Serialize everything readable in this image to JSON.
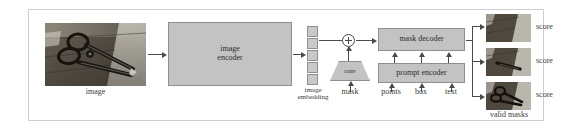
{
  "figure": {
    "frame_color": "#cfcfcf",
    "block_fill": "#c3c3c3",
    "block_stroke": "#8f8f8f",
    "line_color": "#4a4a4a"
  },
  "input": {
    "label": "image",
    "photo_alt": "photograph of scissors on a dark wooden surface"
  },
  "image_encoder": {
    "label_line1": "image",
    "label_line2": "encoder"
  },
  "image_embedding": {
    "label_line1": "image",
    "label_line2": "embedding",
    "cell_count": 5
  },
  "operator": {
    "symbol": "plus-in-circle",
    "name": "element-wise-sum"
  },
  "conv": {
    "label": "conv"
  },
  "mask_decoder": {
    "label": "mask decoder"
  },
  "prompt_encoder": {
    "label": "prompt encoder"
  },
  "prompts": [
    {
      "label": "mask"
    },
    {
      "label": "points"
    },
    {
      "label": "box"
    },
    {
      "label": "text"
    }
  ],
  "outputs": {
    "group_label": "valid masks",
    "masks": [
      {
        "score_label": "score",
        "alt": "mask proposal 1"
      },
      {
        "score_label": "score",
        "alt": "mask proposal 2"
      },
      {
        "score_label": "score",
        "alt": "mask proposal 3"
      }
    ]
  }
}
